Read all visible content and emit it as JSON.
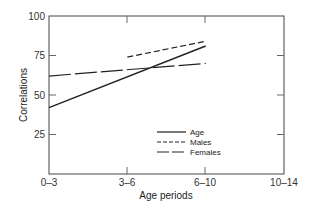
{
  "chart_data": {
    "type": "line",
    "title": "",
    "xlabel": "Age periods",
    "ylabel": "Correlations",
    "categories": [
      "0–3",
      "3–6",
      "6–10",
      "10–14"
    ],
    "ylim": [
      0,
      100
    ],
    "yticks": [
      25,
      50,
      75,
      100
    ],
    "grid": false,
    "legend_position": "lower-right-inside",
    "series": [
      {
        "name": "Age",
        "style": "solid",
        "points": [
          {
            "x": "0–3",
            "y": 42
          },
          {
            "x": "6–10",
            "y": 81
          }
        ]
      },
      {
        "name": "Males",
        "style": "short-dash",
        "points": [
          {
            "x": "3–6",
            "y": 74
          },
          {
            "x": "6–10",
            "y": 84
          }
        ]
      },
      {
        "name": "Females",
        "style": "long-dash",
        "points": [
          {
            "x": "0–3",
            "y": 62
          },
          {
            "x": "6–10",
            "y": 70
          }
        ]
      }
    ]
  },
  "labels": {
    "xlabel": "Age periods",
    "ylabel": "Correlations",
    "yticks": [
      "25",
      "50",
      "75",
      "100"
    ],
    "xticks": [
      "0–3",
      "3–6",
      "6–10",
      "10–14"
    ],
    "legend": [
      "Age",
      "Males",
      "Females"
    ]
  },
  "colors": {
    "line": "#222222",
    "axis": "#444444"
  }
}
